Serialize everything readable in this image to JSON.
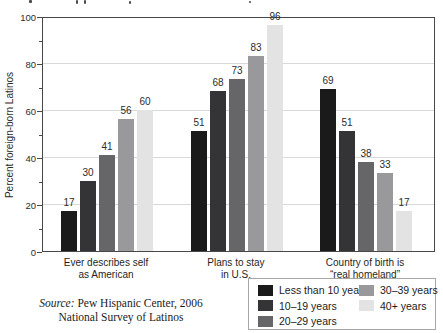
{
  "chart_data": {
    "type": "bar",
    "title": "",
    "ylabel": "Percent foreign-born Latinos",
    "xlabel": "",
    "ylim": [
      0,
      100
    ],
    "yticks": [
      0,
      20,
      40,
      60,
      80,
      100
    ],
    "minor_yticks": [
      10,
      30,
      50,
      70,
      90
    ],
    "grid": true,
    "bar_value_labels": true,
    "legend_position": "bottom-right",
    "categories": [
      "Ever describes self\nas American",
      "Plans to stay\nin U.S.",
      "Country of birth is\n“real homeland”"
    ],
    "series": [
      {
        "name": "Less than 10 years",
        "color": "#1a1a1a",
        "values": [
          17,
          51,
          69
        ]
      },
      {
        "name": "10–19 years",
        "color": "#343436",
        "values": [
          30,
          68,
          51
        ]
      },
      {
        "name": "20–29 years",
        "color": "#666668",
        "values": [
          41,
          73,
          38
        ]
      },
      {
        "name": "30–39 years",
        "color": "#99999b",
        "values": [
          56,
          83,
          33
        ]
      },
      {
        "name": "40+ years",
        "color": "#e3e3e3",
        "values": [
          60,
          96,
          17
        ]
      }
    ]
  },
  "source": {
    "label": "Source:",
    "line1_rest": "Pew Hispanic Center, 2006",
    "line2": "National Survey of Latinos"
  }
}
